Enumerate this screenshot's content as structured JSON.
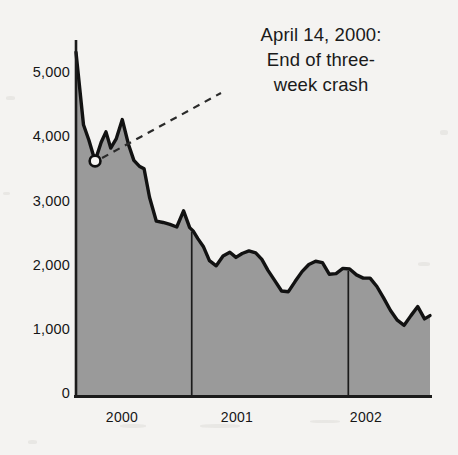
{
  "figure": {
    "background_color": "#f4f3f1",
    "ink_color": "#161616",
    "fill_color": "#9a9a9a"
  },
  "annotation": {
    "line1": "April 14, 2000:",
    "line2": "End of three-",
    "line3": "week crash",
    "marker_label": "April 14, 2000 data point",
    "marker_value": 3640
  },
  "chart_data": {
    "type": "area",
    "title": "",
    "subtitle": "",
    "xlabel": "",
    "ylabel": "",
    "xlim": [
      0,
      31
    ],
    "ylim": [
      0,
      5400
    ],
    "yticks": [
      0,
      1000,
      2000,
      3000,
      4000,
      5000
    ],
    "ytick_labels": [
      "0",
      "1,000",
      "2,000",
      "3,000",
      "4,000",
      "5,000"
    ],
    "xticks": [
      2.7,
      11.6,
      21.4
    ],
    "xtick_labels": [
      "2000",
      "2001",
      "2002"
    ],
    "year_dividers": [
      8.5,
      20.0
    ],
    "grid": false,
    "legend": null,
    "annotations": [
      {
        "text": "April 14, 2000: End of three-week crash",
        "x": 1.4,
        "y": 3640,
        "marker": "open-circle"
      }
    ],
    "series": [
      {
        "name": "Index level",
        "fill": true,
        "x": [
          0.0,
          0.55,
          0.95,
          1.4,
          1.85,
          2.2,
          2.55,
          2.95,
          3.4,
          3.85,
          4.25,
          4.65,
          5.0,
          5.4,
          5.9,
          6.4,
          6.9,
          7.4,
          7.9,
          8.35,
          8.6,
          8.95,
          9.35,
          9.8,
          10.3,
          10.8,
          11.3,
          11.75,
          12.2,
          12.7,
          13.2,
          13.65,
          14.1,
          14.6,
          15.1,
          15.6,
          16.1,
          16.6,
          17.1,
          17.6,
          18.1,
          18.6,
          19.1,
          19.6,
          20.1,
          20.6,
          21.1,
          21.6,
          22.1,
          22.6,
          23.1,
          23.6,
          24.1,
          24.6,
          25.1,
          25.6,
          26.0
        ],
        "values": [
          5320,
          4200,
          3960,
          3640,
          3930,
          4090,
          3840,
          3980,
          4280,
          3900,
          3650,
          3560,
          3520,
          3080,
          2710,
          2690,
          2660,
          2620,
          2870,
          2610,
          2560,
          2440,
          2320,
          2100,
          2020,
          2170,
          2230,
          2150,
          2210,
          2250,
          2220,
          2120,
          1950,
          1790,
          1630,
          1620,
          1780,
          1930,
          2040,
          2090,
          2070,
          1890,
          1900,
          1980,
          1970,
          1880,
          1830,
          1830,
          1700,
          1520,
          1330,
          1180,
          1100,
          1250,
          1390,
          1200,
          1250
        ]
      }
    ]
  },
  "axes": {
    "y_axis_name": "value-axis",
    "x_axis_name": "time-axis"
  }
}
